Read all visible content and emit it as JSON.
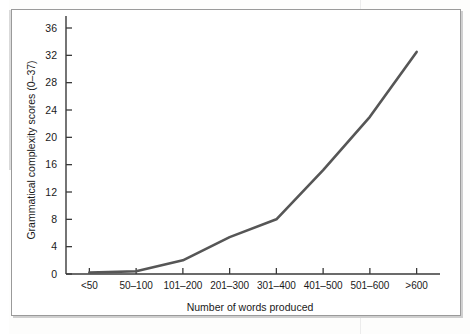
{
  "figure": {
    "background_color": "#ffffff",
    "frame_color": "#9a9a9a",
    "line_color": "#565656",
    "axis_color": "#3a3a3a",
    "text_color": "#1a1a1a"
  },
  "chart_data": {
    "type": "line",
    "title": "",
    "xlabel": "Number of words produced",
    "ylabel": "Grammatical complexity scores (0–37)",
    "categories": [
      "<50",
      "50–100",
      "101–200",
      "201–300",
      "301–400",
      "401–500",
      "501–600",
      ">600"
    ],
    "values": [
      0.2,
      0.4,
      2.0,
      5.4,
      8.0,
      15.2,
      23.0,
      32.5
    ],
    "ylim": [
      0,
      38
    ],
    "yticks": [
      0,
      4,
      8,
      12,
      16,
      20,
      24,
      28,
      32,
      36
    ],
    "ytick_labels": [
      "0",
      "4",
      "8",
      "12",
      "16",
      "20",
      "24",
      "28",
      "32",
      "36"
    ],
    "grid": false,
    "legend": null,
    "legend_position": "none",
    "series": [
      {
        "name": "Grammatical complexity",
        "values": [
          0.2,
          0.4,
          2.0,
          5.4,
          8.0,
          15.2,
          23.0,
          32.5
        ]
      }
    ]
  }
}
